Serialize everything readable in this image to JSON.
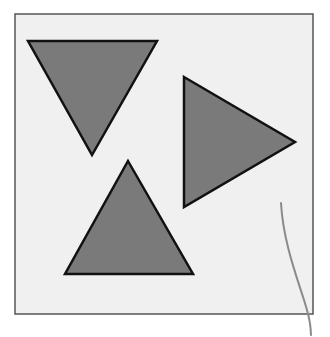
{
  "canvas": {
    "width": 330,
    "height": 337,
    "background": "#ffffff"
  },
  "frame": {
    "x": 15,
    "y": 14,
    "width": 298,
    "height": 300,
    "fill": "#f0f0f0",
    "stroke": "#555555",
    "stroke_width": 1.5
  },
  "shapes": [
    {
      "name": "triangle-pointing-down",
      "points": "28,41 157,41 92,155",
      "fill": "#7a7a7a",
      "stroke": "#111111",
      "stroke_width": 2.5
    },
    {
      "name": "triangle-pointing-right",
      "points": "184,77 295,142 184,207",
      "fill": "#7a7a7a",
      "stroke": "#111111",
      "stroke_width": 2.5
    },
    {
      "name": "triangle-pointing-up",
      "points": "128,161 193,274 65,274",
      "fill": "#7a7a7a",
      "stroke": "#111111",
      "stroke_width": 2.5
    }
  ],
  "pencil_mark": {
    "path": "M281,203 C283,240 296,275 304,300 S310,325 311,335",
    "stroke": "#8a8a8a",
    "stroke_width": 2
  }
}
